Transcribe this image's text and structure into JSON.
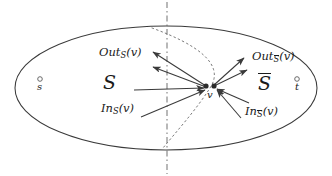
{
  "figure": {
    "name": "graph-cut-diagram",
    "stroke_color": "#3a3a3a",
    "text_color": "#1a1a1a",
    "background": "#ffffff"
  },
  "regions": {
    "left_label": "S",
    "right_label_base": "S",
    "right_label_has_overline": true
  },
  "nodes": {
    "source": {
      "label": "s",
      "x": 40,
      "y": 79
    },
    "sink": {
      "label": "t",
      "x": 297,
      "y": 79
    },
    "vertex": {
      "label": "v",
      "x": 211,
      "y": 87
    }
  },
  "edge_labels": {
    "out_s": {
      "prefix": "Out",
      "subscript": "S",
      "subscript_overline": false,
      "arg": "(v)"
    },
    "out_sbar": {
      "prefix": "Out",
      "subscript": "S",
      "subscript_overline": true,
      "arg": "(v)"
    },
    "in_s": {
      "prefix": "In",
      "subscript": "S",
      "subscript_overline": false,
      "arg": "(v)"
    },
    "in_sbar": {
      "prefix": "In",
      "subscript": "S",
      "subscript_overline": true,
      "arg": "(v)"
    }
  },
  "geometry": {
    "ellipse": {
      "cx": 166,
      "cy": 88,
      "rx": 151,
      "ry": 62
    },
    "divider": {
      "x": 167,
      "y_top": 2,
      "y_bottom": 174,
      "style": "dash-dot"
    },
    "cut_curve": {
      "style": "dotted",
      "path": "M 152 28 C 196 44, 226 64, 210 88 C 196 110, 176 132, 163 148"
    }
  },
  "arrows": {
    "out_s_edges": [
      {
        "from_x": 206,
        "from_y": 86,
        "to_x": 151,
        "to_y": 51
      },
      {
        "from_x": 206,
        "from_y": 87,
        "to_x": 151,
        "to_y": 67
      }
    ],
    "out_sbar_edges": [
      {
        "from_x": 214,
        "from_y": 85,
        "to_x": 246,
        "to_y": 57
      },
      {
        "from_x": 214,
        "from_y": 86,
        "to_x": 249,
        "to_y": 69
      }
    ],
    "in_s_edges": [
      {
        "from_x": 134,
        "from_y": 90,
        "to_x": 205,
        "to_y": 88
      },
      {
        "from_x": 141,
        "from_y": 117,
        "to_x": 206,
        "to_y": 89
      }
    ],
    "in_sbar_edges": [
      {
        "from_x": 247,
        "from_y": 102,
        "to_x": 216,
        "to_y": 89
      },
      {
        "from_x": 239,
        "from_y": 117,
        "to_x": 216,
        "to_y": 90
      }
    ]
  }
}
